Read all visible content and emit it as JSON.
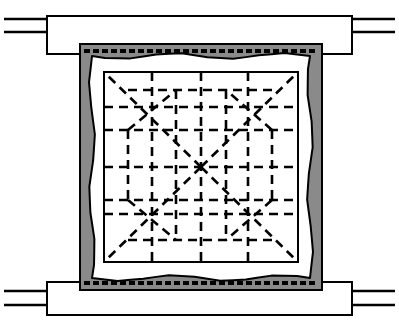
{
  "figure": {
    "kind": "architectural-site-plan",
    "title": "",
    "caption": "",
    "width": 399,
    "height": 325,
    "background_color": "#ffffff",
    "ink_color": "#000000"
  },
  "colors": {
    "ink": "#000000",
    "paper": "#ffffff",
    "rampart_fill": "#8a8a8a",
    "corridor_fill": "#ffffff",
    "court_fill": "#ffffff"
  },
  "geometry": {
    "rampart_band": {
      "label": "rampart-band",
      "x": 80,
      "y": 44,
      "width": 242,
      "height": 246,
      "fill": "#8a8a8a",
      "stroke_width": 2
    },
    "tick_row_top": {
      "label": "tick-row-top",
      "y": 49,
      "x_start": 84,
      "x_end": 318,
      "count": 26,
      "dash_length": 6,
      "thickness": 4
    },
    "tick_row_bottom": {
      "label": "tick-row-bottom",
      "y": 281,
      "x_start": 84,
      "x_end": 318,
      "count": 26,
      "dash_length": 6,
      "thickness": 4
    },
    "wavy_corridor": {
      "label": "wavy-corridor-outline",
      "x": 92,
      "y": 56,
      "width": 218,
      "height": 222,
      "amplitude": 3,
      "wavelength": 13,
      "stroke_width": 2,
      "fill": "#ffffff"
    },
    "court_square": {
      "label": "inner-court-square",
      "x": 104,
      "y": 72,
      "width": 194,
      "height": 190,
      "stroke_width": 2,
      "fill": "#ffffff"
    },
    "court_center": {
      "x": 201,
      "y": 167
    },
    "grid_vertical_x": [
      152,
      201,
      248
    ],
    "grid_horizontal_y": [
      107,
      167,
      214
    ],
    "grid_inner_vertical_x": [
      128,
      176,
      226,
      272
    ],
    "grid_inner_horizontal_y": [
      90,
      130,
      200,
      240
    ],
    "dash_pattern": "9 6",
    "dash_stroke_width": 2.6
  },
  "wings": {
    "top": {
      "label": "north-wing",
      "x": 47,
      "y": 16,
      "width": 305,
      "height": 38,
      "fill": "#ffffff",
      "stroke_width": 2,
      "left_leads": [
        {
          "label": "north-wing-lead-upper-left",
          "x1": 4,
          "y1": 19,
          "x2": 47,
          "y2": 19
        },
        {
          "label": "north-wing-lead-lower-left",
          "x1": 4,
          "y1": 32,
          "x2": 47,
          "y2": 32
        }
      ],
      "right_leads": [
        {
          "label": "north-wing-lead-upper-right",
          "x1": 352,
          "y1": 19,
          "x2": 395,
          "y2": 19
        },
        {
          "label": "north-wing-lead-lower-right",
          "x1": 352,
          "y1": 32,
          "x2": 395,
          "y2": 32
        }
      ]
    },
    "bottom": {
      "label": "south-wing",
      "x": 47,
      "y": 282,
      "width": 305,
      "height": 33,
      "fill": "#ffffff",
      "stroke_width": 2,
      "left_leads": [
        {
          "label": "south-wing-lead-upper-left",
          "x1": 4,
          "y1": 291,
          "x2": 47,
          "y2": 291
        },
        {
          "label": "south-wing-lead-lower-left",
          "x1": 4,
          "y1": 305,
          "x2": 47,
          "y2": 305
        }
      ],
      "right_leads": [
        {
          "label": "south-wing-lead-upper-right",
          "x1": 352,
          "y1": 291,
          "x2": 395,
          "y2": 291
        },
        {
          "label": "south-wing-lead-lower-right",
          "x1": 352,
          "y1": 305,
          "x2": 395,
          "y2": 305
        }
      ]
    }
  },
  "diagonals": {
    "label": "corner-diagonals",
    "from_center_to_corners": [
      {
        "label": "diagonal-center-to-nw",
        "x1": 201,
        "y1": 167,
        "x2": 104,
        "y2": 72
      },
      {
        "label": "diagonal-center-to-ne",
        "x1": 201,
        "y1": 167,
        "x2": 298,
        "y2": 72
      },
      {
        "label": "diagonal-center-to-sw",
        "x1": 201,
        "y1": 167,
        "x2": 104,
        "y2": 262
      },
      {
        "label": "diagonal-center-to-se",
        "x1": 201,
        "y1": 167,
        "x2": 298,
        "y2": 262
      }
    ]
  }
}
